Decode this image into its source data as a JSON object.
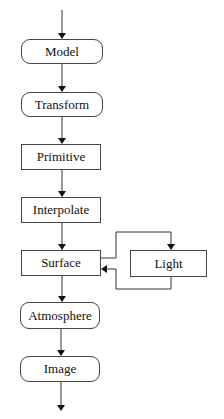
{
  "diagram": {
    "title": "",
    "nodes": [
      {
        "id": "model",
        "label": "Model",
        "shape": "rounded"
      },
      {
        "id": "transform",
        "label": "Transform",
        "shape": "rounded"
      },
      {
        "id": "primitive",
        "label": "Primitive",
        "shape": "rect"
      },
      {
        "id": "interpolate",
        "label": "Interpolate",
        "shape": "rect"
      },
      {
        "id": "surface",
        "label": "Surface",
        "shape": "rect"
      },
      {
        "id": "light",
        "label": "Light",
        "shape": "rect"
      },
      {
        "id": "atmosphere",
        "label": "Atmosphere",
        "shape": "rounded"
      },
      {
        "id": "image",
        "label": "Image",
        "shape": "rounded"
      }
    ],
    "edges": [
      {
        "from": "input",
        "to": "model"
      },
      {
        "from": "model",
        "to": "transform"
      },
      {
        "from": "transform",
        "to": "primitive"
      },
      {
        "from": "primitive",
        "to": "interpolate"
      },
      {
        "from": "interpolate",
        "to": "surface"
      },
      {
        "from": "surface",
        "to": "light"
      },
      {
        "from": "light",
        "to": "surface"
      },
      {
        "from": "surface",
        "to": "atmosphere"
      },
      {
        "from": "atmosphere",
        "to": "image"
      },
      {
        "from": "image",
        "to": "output"
      }
    ]
  }
}
